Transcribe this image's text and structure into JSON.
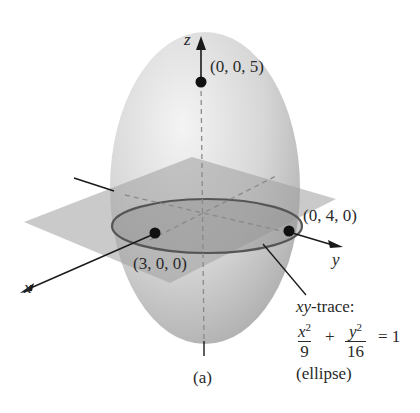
{
  "figure": {
    "caption": "(a)",
    "axes": {
      "x": "x",
      "y": "y",
      "z": "z"
    },
    "points": [
      {
        "label": "(0, 0, 5)",
        "coord": [
          0,
          0,
          5
        ]
      },
      {
        "label": "(0, 4, 0)",
        "coord": [
          0,
          4,
          0
        ]
      },
      {
        "label": "(3, 0, 0)",
        "coord": [
          3,
          0,
          0
        ]
      }
    ],
    "annotation": {
      "title_italic": "xy",
      "title_rest": "-trace:",
      "term1_num": "x",
      "term1_exp": "2",
      "term1_den": "9",
      "plus": "+",
      "term2_num": "y",
      "term2_exp": "2",
      "term2_den": "16",
      "equals": "= 1",
      "note": "(ellipse)"
    },
    "colors": {
      "surface": "#cfcfcf",
      "plane": "#b8b8b8",
      "trace": "#5a5a5a",
      "ink": "#1a1a1a"
    }
  }
}
